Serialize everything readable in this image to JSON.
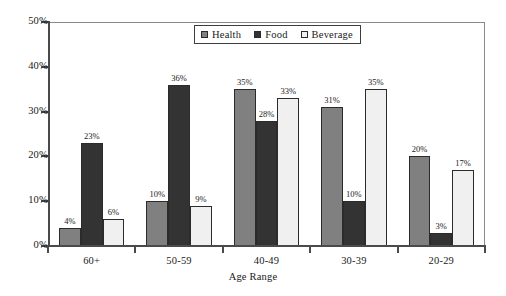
{
  "chart_data": {
    "type": "bar",
    "title": "",
    "xlabel": "Age Range",
    "ylabel": "",
    "categories": [
      "60+",
      "50-59",
      "40-49",
      "30-39",
      "20-29"
    ],
    "series": [
      {
        "name": "Health",
        "values": [
          4,
          10,
          35,
          31,
          20
        ],
        "color": "#808080"
      },
      {
        "name": "Food",
        "values": [
          23,
          36,
          28,
          10,
          3
        ],
        "color": "#333333"
      },
      {
        "name": "Beverage",
        "values": [
          6,
          9,
          33,
          35,
          17
        ],
        "color": "#f0f0f0"
      }
    ],
    "data_labels": [
      [
        "4%",
        "10%",
        "35%",
        "31%",
        "20%"
      ],
      [
        "23%",
        "36%",
        "28%",
        "10%",
        "3%"
      ],
      [
        "6%",
        "9%",
        "33%",
        "35%",
        "17%"
      ]
    ],
    "ylim": [
      0,
      50
    ],
    "yticks": [
      0,
      10,
      20,
      30,
      40,
      50
    ],
    "ytick_labels": [
      "0%",
      "10%",
      "20%",
      "30%",
      "40%",
      "50%"
    ],
    "grid": false,
    "legend_position": "top-center",
    "value_suffix": "%"
  },
  "legend": {
    "entries": [
      {
        "label": "Health",
        "color": "#808080"
      },
      {
        "label": "Food",
        "color": "#333333"
      },
      {
        "label": "Beverage",
        "color": "#f0f0f0"
      }
    ]
  },
  "axes": {
    "x_title": "Age Range"
  },
  "colors": {
    "health": "#808080",
    "food": "#333333",
    "beverage": "#f0f0f0",
    "axis": "#4a4a4a",
    "frame": "#8a8a8a",
    "text": "#1a1a1a",
    "background": "#ffffff"
  }
}
